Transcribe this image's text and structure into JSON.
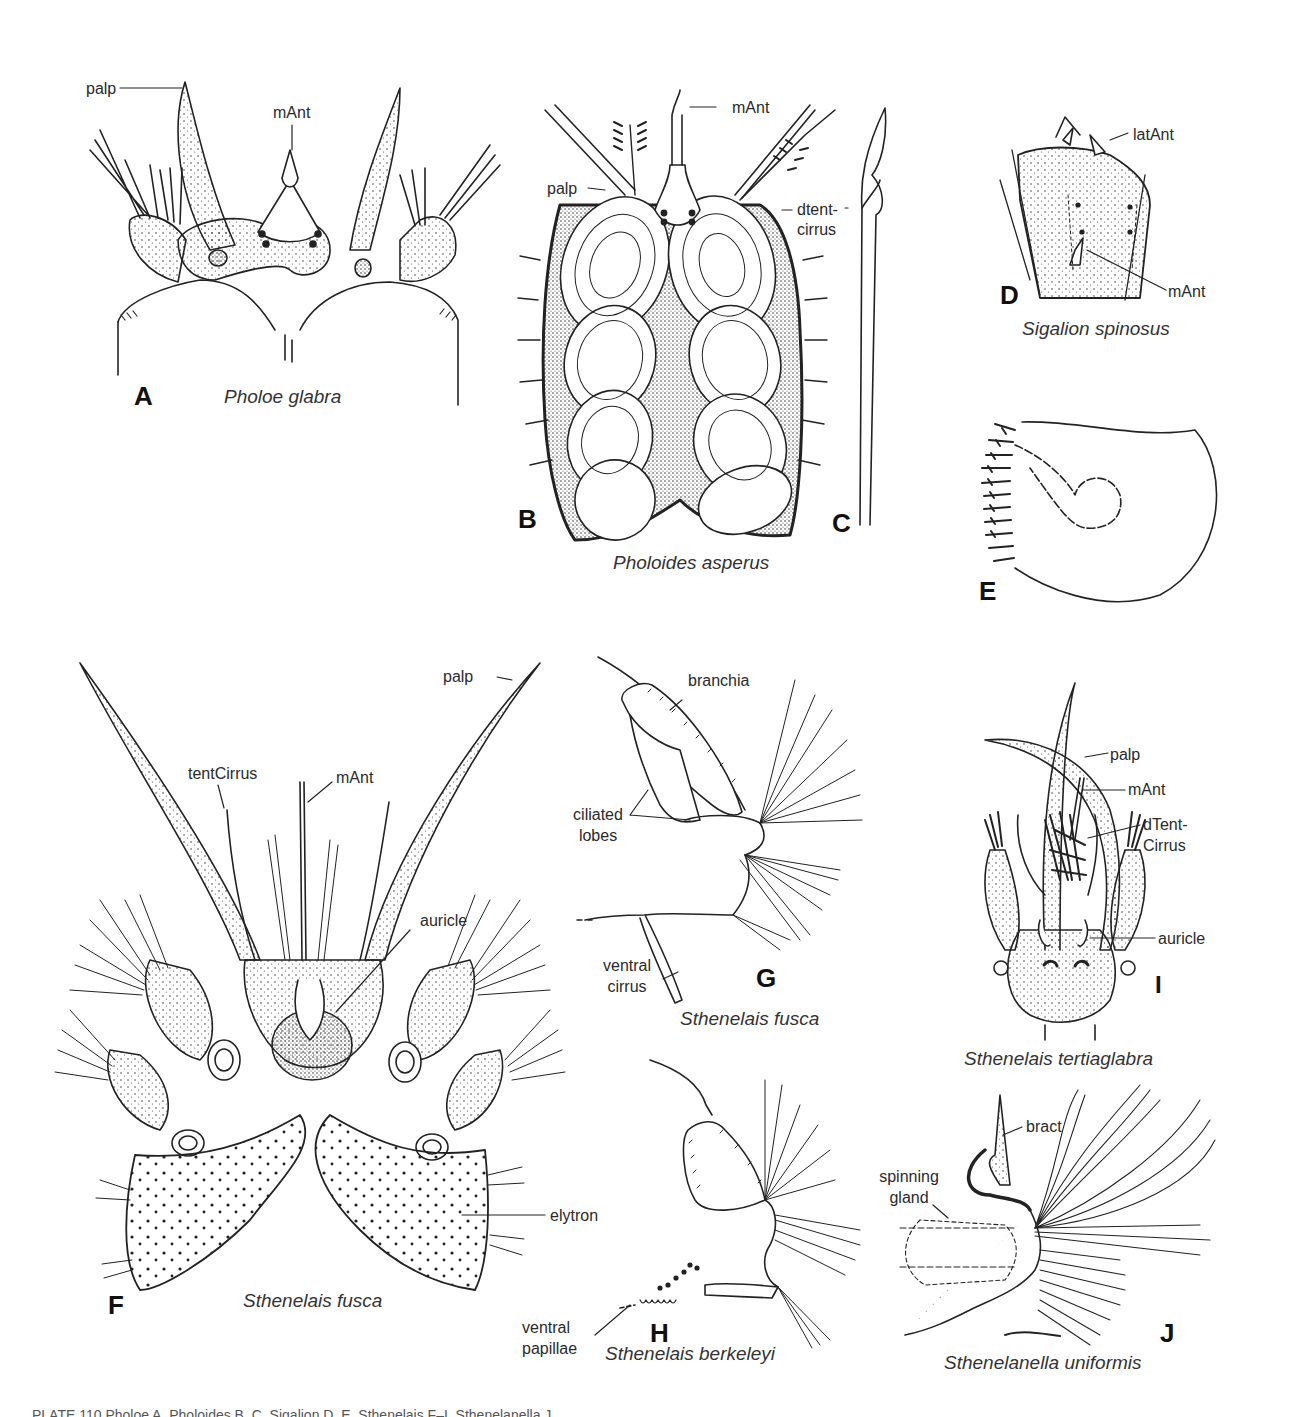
{
  "plate": {
    "caption": "PLATE 110 Pholoe A, Pholoides B, C, Sigalion D, E, Sthenelais F–I, Sthenelanella J",
    "figures": [
      {
        "letter": "A",
        "species": "Pholoe glabra",
        "labels": [
          "palp",
          "mAnt"
        ]
      },
      {
        "letter": "B",
        "species": "Pholoides asperus",
        "labels": [
          "palp",
          "mAnt",
          "dtent-",
          "cirrus"
        ]
      },
      {
        "letter": "C",
        "species": "",
        "labels": []
      },
      {
        "letter": "D",
        "species": "Sigalion spinosus",
        "labels": [
          "latAnt",
          "mAnt"
        ]
      },
      {
        "letter": "E",
        "species": "",
        "labels": []
      },
      {
        "letter": "F",
        "species": "Sthenelais fusca",
        "labels": [
          "palp",
          "tentCirrus",
          "mAnt",
          "auricle",
          "elytron"
        ]
      },
      {
        "letter": "G",
        "species": "Sthenelais fusca",
        "labels": [
          "branchia",
          "ciliated",
          "lobes",
          "ventral",
          "cirrus"
        ]
      },
      {
        "letter": "H",
        "species": "Sthenelais berkeleyi",
        "labels": [
          "ventral",
          "papillae"
        ]
      },
      {
        "letter": "I",
        "species": "Sthenelais tertiaglabra",
        "labels": [
          "palp",
          "mAnt",
          "dTent-",
          "Cirrus",
          "auricle"
        ]
      },
      {
        "letter": "J",
        "species": "Sthenelanella uniformis",
        "labels": [
          "bract",
          "spinning",
          "gland"
        ]
      }
    ]
  }
}
